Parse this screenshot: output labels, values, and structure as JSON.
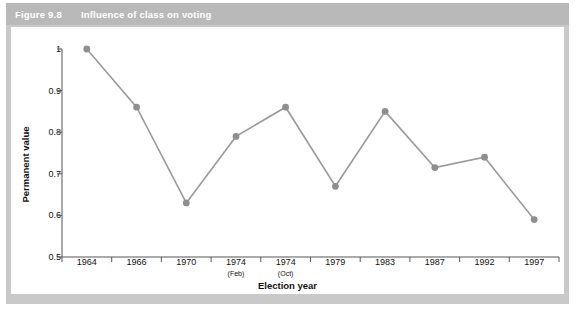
{
  "figure": {
    "number": "Figure 9.8",
    "title": "Influence of class on voting"
  },
  "colors": {
    "frame": "#c9c9c9",
    "header_band": "#b9b9b9",
    "header_text": "#ffffff",
    "plot_background": "#ffffff",
    "line": "#9a9a9a",
    "marker": "#8f8f8f",
    "axis": "#555555",
    "tick_text": "#111111"
  },
  "chart_data": {
    "type": "line",
    "title": "Influence of class on voting",
    "xlabel": "Election year",
    "ylabel": "Permanent value",
    "categories": [
      "1964",
      "1966",
      "1970",
      "1974",
      "1974",
      "1979",
      "1983",
      "1987",
      "1992",
      "1997"
    ],
    "category_sublabels": [
      "",
      "",
      "",
      "(Feb)",
      "(Oct)",
      "",
      "",
      "",
      "",
      ""
    ],
    "values": [
      1.0,
      0.86,
      0.63,
      0.79,
      0.86,
      0.67,
      0.85,
      0.715,
      0.74,
      0.59
    ],
    "ylim": [
      0.5,
      1.0
    ],
    "yticks": [
      "0.5",
      "0.6",
      "0.7",
      "0.8",
      "0.9",
      "1"
    ],
    "ytick_values": [
      0.5,
      0.6,
      0.7,
      0.8,
      0.9,
      1.0
    ],
    "grid": false,
    "legend": "none",
    "markers": "circle"
  }
}
